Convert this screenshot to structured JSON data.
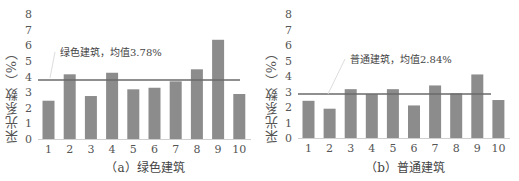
{
  "chart_data": [
    {
      "type": "bar",
      "title": "（a）绿色建筑",
      "xlabel": "",
      "ylabel": "采光系数（%）",
      "categories": [
        "1",
        "2",
        "3",
        "4",
        "5",
        "6",
        "7",
        "8",
        "9",
        "10"
      ],
      "values": [
        2.45,
        4.14,
        2.75,
        4.24,
        3.18,
        3.28,
        3.69,
        4.46,
        6.35,
        2.88
      ],
      "ylim": [
        0,
        8
      ],
      "yticks": [
        0,
        1,
        2,
        3,
        4,
        5,
        6,
        7,
        8
      ],
      "grid": false,
      "mean_line": {
        "value": 3.78,
        "label": "绿色建筑，均值3.78%"
      },
      "bar_color": "#8c8c8c",
      "line_color": "#6a6a6a"
    },
    {
      "type": "bar",
      "title": "（b）普通建筑",
      "xlabel": "",
      "ylabel": "采光系数（%）",
      "categories": [
        "1",
        "2",
        "3",
        "4",
        "5",
        "6",
        "7",
        "8",
        "9",
        "10"
      ],
      "values": [
        2.4,
        1.89,
        3.15,
        2.83,
        3.15,
        2.1,
        3.39,
        2.88,
        4.1,
        2.45
      ],
      "ylim": [
        0,
        8
      ],
      "yticks": [
        0,
        1,
        2,
        3,
        4,
        5,
        6,
        7,
        8
      ],
      "grid": false,
      "mean_line": {
        "value": 2.84,
        "label": "普通建筑，均值2.84%"
      },
      "bar_color": "#8c8c8c",
      "line_color": "#6a6a6a"
    }
  ]
}
